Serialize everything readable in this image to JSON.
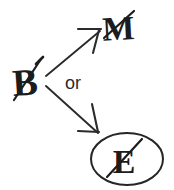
{
  "diagram": {
    "background_color": "#ffffff",
    "ink_color": "#1c1c1c",
    "nodes": [
      {
        "id": "source",
        "label": "B",
        "role": "source-node",
        "struck_through": true,
        "circled": false,
        "x": 26,
        "y": 82
      },
      {
        "id": "option-upper",
        "label": "M",
        "role": "target-node-upper",
        "struck_through": true,
        "circled": false,
        "x": 119,
        "y": 27
      },
      {
        "id": "option-lower",
        "label": "E",
        "role": "target-node-lower",
        "struck_through": true,
        "circled": true,
        "x": 126,
        "y": 160
      }
    ],
    "edges": [
      {
        "id": "edge-upper",
        "from": "source",
        "to": "option-upper",
        "arrowhead": true,
        "direction": "up-right"
      },
      {
        "id": "edge-lower",
        "from": "source",
        "to": "option-lower",
        "arrowhead": true,
        "direction": "down-right"
      }
    ],
    "connector_label": "or",
    "ellipse": {
      "center_x": 127,
      "center_y": 159,
      "radius_x": 36,
      "radius_y": 26
    }
  }
}
